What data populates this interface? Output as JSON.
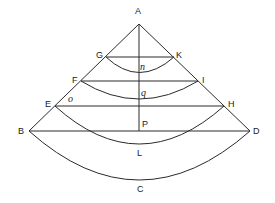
{
  "diagram": {
    "type": "geometric-construction",
    "points": {
      "A": "A",
      "G": "G",
      "K": "K",
      "F": "F",
      "I": "I",
      "E": "E",
      "H": "H",
      "B": "B",
      "D": "D"
    },
    "arc_labels": {
      "n": "n",
      "q": "q",
      "L": "L",
      "C": "C"
    },
    "other_labels": {
      "o": "o",
      "P": "P"
    }
  }
}
